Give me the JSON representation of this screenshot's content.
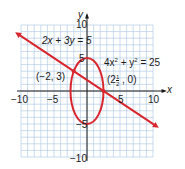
{
  "chart_data": {
    "type": "line",
    "title": "",
    "xlabel": "x",
    "ylabel": "y",
    "xlim": [
      -10,
      10
    ],
    "ylim": [
      -10,
      10
    ],
    "grid": true,
    "grid_step": 1,
    "x_ticks": [
      {
        "value": -10,
        "label": "−10"
      },
      {
        "value": -5,
        "label": "−5"
      },
      {
        "value": 5,
        "label": "5"
      },
      {
        "value": 10,
        "label": "10"
      }
    ],
    "y_ticks": [
      {
        "value": 10,
        "label": "10"
      },
      {
        "value": 5,
        "label": "5"
      },
      {
        "value": -5,
        "label": "−5"
      },
      {
        "value": -10,
        "label": "−10"
      }
    ],
    "series": [
      {
        "name": "2x + 3y = 5",
        "kind": "line",
        "equation": "2x + 3y = 5",
        "x": [
          -10.5,
          10.5
        ],
        "y": [
          8.667,
          -5.333
        ],
        "arrows": "both",
        "color": "#d9262e"
      },
      {
        "name": "4x² + y² = 25",
        "kind": "ellipse",
        "equation": "4x² + y² = 25",
        "center": [
          0,
          0
        ],
        "semi_axis_x": 2.5,
        "semi_axis_y": 5,
        "color": "#d9262e"
      }
    ],
    "points": [
      {
        "label": "(−2, 3)",
        "x": -2,
        "y": 3
      },
      {
        "label": "(2½, 0)",
        "x": 2.5,
        "y": 0
      }
    ],
    "annotations": [
      {
        "text": "2x + 3y = 5"
      },
      {
        "text": "4x² + y² = 25"
      },
      {
        "text": "(−2, 3)"
      },
      {
        "text": "(2½, 0)"
      }
    ]
  },
  "labels": {
    "line_eq": "2x + 3y = 5",
    "ellipse_eq_a": "4x",
    "ellipse_eq_sup1": "2",
    "ellipse_eq_b": " + y",
    "ellipse_eq_sup2": "2",
    "ellipse_eq_c": " = 25",
    "point_a": "(−2, 3)",
    "point_b_open": "(2",
    "point_b_num": "1",
    "point_b_den": "2",
    "point_b_close": " , 0)",
    "x_axis": "x",
    "y_axis": "y",
    "xt_m10": "−10",
    "xt_m5": "−5",
    "xt_5": "5",
    "xt_10": "10",
    "yt_10": "10",
    "yt_5": "5",
    "yt_m5": "−5",
    "yt_m10": "−10"
  },
  "colors": {
    "grid": "#a9c4e4",
    "axis": "#1a1a1a",
    "curve": "#d9262e"
  }
}
